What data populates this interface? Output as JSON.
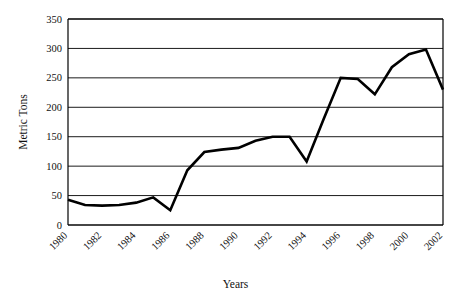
{
  "chart_data": {
    "type": "line",
    "title": "",
    "xlabel": "Years",
    "ylabel": "Metric Tons",
    "xlim": [
      1980,
      2002
    ],
    "ylim": [
      0,
      350
    ],
    "yticks": [
      0,
      50,
      100,
      150,
      200,
      250,
      300,
      350
    ],
    "ytick_labels": [
      "0",
      "50",
      "100",
      "150",
      "200",
      "250",
      "300",
      "350"
    ],
    "xticks": [
      1980,
      1982,
      1984,
      1986,
      1988,
      1990,
      1992,
      1994,
      1996,
      1998,
      2000,
      2002
    ],
    "xtick_labels": [
      "1980",
      "1982",
      "1984",
      "1986",
      "1988",
      "1990",
      "1992",
      "1994",
      "1996",
      "1998",
      "2000",
      "2002"
    ],
    "grid": "horizontal",
    "legend": "none",
    "line_color": "#000000",
    "line_width": 2.6,
    "markers": "none",
    "x": [
      1980,
      1981,
      1982,
      1983,
      1984,
      1985,
      1986,
      1987,
      1988,
      1989,
      1990,
      1991,
      1992,
      1993,
      1994,
      1995,
      1996,
      1997,
      1998,
      1999,
      2000,
      2001,
      2002
    ],
    "values": [
      43,
      34,
      33,
      34,
      38,
      47,
      25,
      93,
      124,
      128,
      131,
      143,
      150,
      150,
      108,
      180,
      250,
      248,
      222,
      268,
      290,
      298,
      230
    ],
    "series": [
      {
        "name": "Metric Tons",
        "values": [
          43,
          34,
          33,
          34,
          38,
          47,
          25,
          93,
          124,
          128,
          131,
          143,
          150,
          150,
          108,
          180,
          250,
          248,
          222,
          268,
          290,
          298,
          230
        ]
      }
    ]
  },
  "layout": {
    "plot_left": 68,
    "plot_right": 443,
    "plot_top": 19,
    "plot_bottom": 225
  }
}
